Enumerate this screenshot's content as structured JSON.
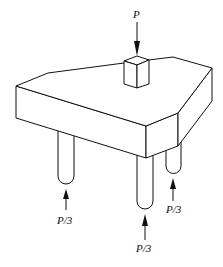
{
  "diagram": {
    "load": {
      "label": "P",
      "direction": "down"
    },
    "reactions": [
      {
        "id": "left-pile",
        "label": "P/3",
        "direction": "up"
      },
      {
        "id": "middle-pile",
        "label": "P/3",
        "direction": "up"
      },
      {
        "id": "right-pile",
        "label": "P/3",
        "direction": "up"
      }
    ],
    "colors": {
      "line": "#111111",
      "background": "#ffffff"
    }
  }
}
